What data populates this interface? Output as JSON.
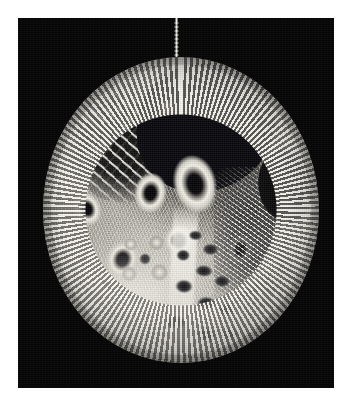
{
  "page": {
    "background_color": "#ffffff",
    "width": 355,
    "height": 415
  },
  "photo": {
    "name": "photograph-plate",
    "background_color": "#060606",
    "bounds": {
      "left": 18,
      "top": 18,
      "width": 316,
      "height": 370
    },
    "alt_text": "Black-and-white photograph of a circular hand-crocheted textile disc suspended from a thread against a black background"
  },
  "artwork": {
    "name": "circular-textile-disc",
    "shape": "circle",
    "diameter_px": 276,
    "palette": {
      "yarn_light": "#f6f5ee",
      "yarn_mid": "#a9a7a0",
      "yarn_shadow": "#3a3a3c",
      "void_black": "#060606"
    },
    "hanging_thread": {
      "name": "hanging-thread",
      "color": "#e2e0d6",
      "length_px": 42
    },
    "regions": [
      {
        "name": "open-lattice-upper-left",
        "description": "open filet mesh lattice work"
      },
      {
        "name": "bobble-cluster-top",
        "description": "dense dark popcorn / bobble stitches"
      },
      {
        "name": "raised-ring-forms",
        "description": "pale raised ring and barnacle forms"
      },
      {
        "name": "flower-cluster-mid-left",
        "description": "pale ruffled flower cluster"
      },
      {
        "name": "ribbed-panel-right",
        "description": "diagonal ribbed panel"
      },
      {
        "name": "eyelet-cone-bottom",
        "description": "teardrop cone of dark eyelet holes"
      },
      {
        "name": "crochet-rim",
        "description": "crocheted edging ring around the perimeter"
      },
      {
        "name": "background-gap-upper-right",
        "description": "notch where black background shows through"
      }
    ]
  }
}
